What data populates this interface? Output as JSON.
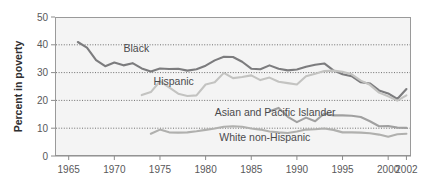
{
  "chart_data": {
    "type": "line",
    "title": "",
    "xlabel": "",
    "ylabel": "Percent in poverty",
    "xlim": [
      1963.5,
      2002.5
    ],
    "ylim": [
      0,
      50
    ],
    "grid": true,
    "gridlines_y": [
      10,
      20,
      30,
      40
    ],
    "legend_position": "inline-labels",
    "yticks": [
      "0",
      "10",
      "20",
      "30",
      "40",
      "50"
    ],
    "ytick_values": [
      0,
      10,
      20,
      30,
      40,
      50
    ],
    "xticks": [
      "1965",
      "1970",
      "1975",
      "1980",
      "1985",
      "1990",
      "1995",
      "2000",
      "2002"
    ],
    "xtick_values": [
      1965,
      1970,
      1975,
      1980,
      1985,
      1990,
      1995,
      2000,
      2002
    ],
    "series": [
      {
        "name": "Black",
        "color": "#7c7c7e",
        "label_x": 1971.0,
        "label_y": 37.4,
        "x": [
          1966,
          1967,
          1968,
          1969,
          1970,
          1971,
          1972,
          1973,
          1974,
          1975,
          1976,
          1977,
          1978,
          1979,
          1980,
          1981,
          1982,
          1983,
          1984,
          1985,
          1986,
          1987,
          1988,
          1989,
          1990,
          1991,
          1992,
          1993,
          1994,
          1995,
          1996,
          1997,
          1998,
          1999,
          2000,
          2001,
          2002
        ],
        "values": [
          41.0,
          39.0,
          34.5,
          32.3,
          33.6,
          32.6,
          33.4,
          31.5,
          30.4,
          31.5,
          31.3,
          31.4,
          30.7,
          31.2,
          32.5,
          34.4,
          35.7,
          35.6,
          33.9,
          31.4,
          31.2,
          32.6,
          31.4,
          30.8,
          31.1,
          32.1,
          32.8,
          33.3,
          30.8,
          29.4,
          28.7,
          26.5,
          26.1,
          23.6,
          22.5,
          20.5,
          24.1
        ]
      },
      {
        "name": "Hispanic",
        "color": "#c3c3c1",
        "label_x": 1974.3,
        "label_y": 25.6,
        "x": [
          1973,
          1974,
          1975,
          1976,
          1977,
          1978,
          1979,
          1980,
          1981,
          1982,
          1983,
          1984,
          1985,
          1986,
          1987,
          1988,
          1989,
          1990,
          1991,
          1992,
          1993,
          1994,
          1995,
          1996,
          1997,
          1998,
          1999,
          2000,
          2001,
          2002
        ],
        "values": [
          21.9,
          23.0,
          26.9,
          24.7,
          22.4,
          21.6,
          21.8,
          25.7,
          26.5,
          29.9,
          28.0,
          28.4,
          29.0,
          27.3,
          28.2,
          26.7,
          26.2,
          25.7,
          28.7,
          29.6,
          30.6,
          30.7,
          30.3,
          29.4,
          27.1,
          25.6,
          22.8,
          21.5,
          19.9,
          21.8
        ]
      },
      {
        "name": "Asian and Pacific Islander",
        "color": "#a0a0a0",
        "label_x": 1981.0,
        "label_y": 14.4,
        "x": [
          1987,
          1988,
          1989,
          1990,
          1991,
          1992,
          1993,
          1994,
          1995,
          1996,
          1997,
          1998,
          1999,
          2000,
          2001,
          2002
        ],
        "values": [
          16.1,
          17.3,
          14.1,
          12.2,
          13.8,
          12.5,
          15.3,
          14.6,
          14.6,
          14.5,
          14.0,
          12.5,
          10.7,
          10.8,
          10.2,
          10.1
        ]
      },
      {
        "name": "White non-Hispanic",
        "color": "#b0b0ae",
        "label_x": 1981.5,
        "label_y": 5.5,
        "x": [
          1974,
          1975,
          1976,
          1977,
          1978,
          1979,
          1980,
          1981,
          1982,
          1983,
          1984,
          1985,
          1986,
          1987,
          1988,
          1989,
          1990,
          1991,
          1992,
          1993,
          1994,
          1995,
          1996,
          1997,
          1998,
          1999,
          2000,
          2001,
          2002
        ],
        "values": [
          8.0,
          9.5,
          8.5,
          8.4,
          8.5,
          8.9,
          9.4,
          9.9,
          10.5,
          10.7,
          10.5,
          9.9,
          9.5,
          8.8,
          8.5,
          8.3,
          8.8,
          9.5,
          9.6,
          9.9,
          9.4,
          8.5,
          8.5,
          8.4,
          8.2,
          7.7,
          6.9,
          7.8,
          8.0
        ]
      }
    ]
  }
}
